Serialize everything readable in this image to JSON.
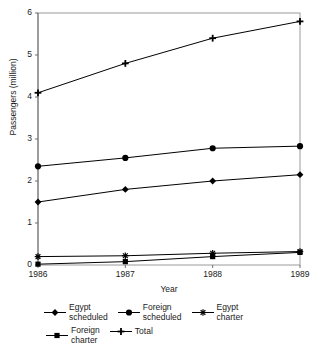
{
  "chart_data": {
    "type": "line",
    "title": "",
    "xlabel": "Year",
    "ylabel": "Passengers (million)",
    "x": [
      1986,
      1987,
      1988,
      1989
    ],
    "categories": [
      "1986",
      "1987",
      "1988",
      "1989"
    ],
    "xtick_labels": [
      "1986",
      "1987",
      "1988",
      "1989"
    ],
    "ytick_labels": [
      "0",
      "1",
      "2",
      "3",
      "4",
      "5",
      "6"
    ],
    "yticks": [
      0,
      1,
      2,
      3,
      4,
      5,
      6
    ],
    "ylim": [
      0,
      6
    ],
    "xlim": [
      1986,
      1989
    ],
    "grid": false,
    "legend_position": "bottom",
    "series": [
      {
        "name": "Egypt scheduled",
        "legend_label": "Egypt\nscheduled",
        "marker": "diamond",
        "color": "#000000",
        "values": [
          1.5,
          1.8,
          2.0,
          2.15
        ]
      },
      {
        "name": "Foreign scheduled",
        "legend_label": "Foreign\nscheduled",
        "marker": "circle",
        "color": "#000000",
        "values": [
          2.35,
          2.55,
          2.78,
          2.83
        ]
      },
      {
        "name": "Egypt charter",
        "legend_label": "Egypt\ncharter",
        "marker": "asterisk",
        "color": "#000000",
        "values": [
          0.2,
          0.22,
          0.28,
          0.32
        ]
      },
      {
        "name": "Foreign charter",
        "legend_label": "Foreign\ncharter",
        "marker": "square",
        "color": "#000000",
        "values": [
          0.02,
          0.08,
          0.2,
          0.3
        ]
      },
      {
        "name": "Total",
        "legend_label": "Total",
        "marker": "plus",
        "color": "#000000",
        "values": [
          4.1,
          4.8,
          5.4,
          5.8
        ]
      }
    ]
  },
  "colors": {
    "background": "#ffffff",
    "line": "#000000",
    "frame": "#9a9a9a",
    "text": "#1a1a1a"
  }
}
